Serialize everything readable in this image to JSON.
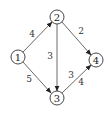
{
  "graph": {
    "nodes": [
      {
        "id": "1",
        "label": "1",
        "x": 18,
        "y": 57
      },
      {
        "id": "2",
        "label": "2",
        "x": 57,
        "y": 17
      },
      {
        "id": "3",
        "label": "3",
        "x": 57,
        "y": 98
      },
      {
        "id": "4",
        "label": "4",
        "x": 96,
        "y": 60
      }
    ],
    "edges": [
      {
        "from": "1",
        "to": "2",
        "label": "4",
        "label_x": 32,
        "label_y": 34
      },
      {
        "from": "1",
        "to": "3",
        "label": "5",
        "label_x": 29,
        "label_y": 79
      },
      {
        "from": "2",
        "to": "3",
        "label": "3",
        "label_x": 50,
        "label_y": 56
      },
      {
        "from": "2",
        "to": "4",
        "label": "2",
        "label_x": 81,
        "label_y": 31
      },
      {
        "from": "3",
        "to": "4",
        "label": "3",
        "label_x": 71,
        "label_y": 75
      },
      {
        "from": "3",
        "to": "4",
        "label": "4",
        "label_x": 81,
        "label_y": 82
      }
    ]
  }
}
